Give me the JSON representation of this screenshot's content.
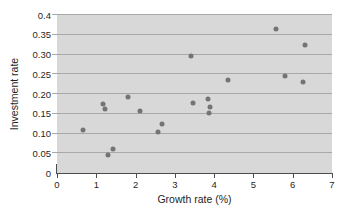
{
  "chart_data": {
    "type": "scatter",
    "xlabel": "Growth rate (%)",
    "ylabel": "Investment rate",
    "xlim": [
      0,
      7
    ],
    "ylim": [
      0,
      0.4
    ],
    "x_ticks": [
      0,
      1,
      2,
      3,
      4,
      5,
      6,
      7
    ],
    "x_tick_labels": [
      "0",
      "1",
      "2",
      "3",
      "4",
      "5",
      "6",
      "7"
    ],
    "y_ticks": [
      0,
      0.05,
      0.1,
      0.15,
      0.2,
      0.25,
      0.3,
      0.35,
      0.4
    ],
    "y_tick_labels": [
      "0",
      "0.05",
      "0.10",
      "0.15",
      "0.20",
      "0.25",
      "0.30",
      "0.35",
      "0.4"
    ],
    "grid": "horizontal",
    "legend": "none",
    "points": [
      [
        0.66,
        0.11
      ],
      [
        1.17,
        0.175
      ],
      [
        1.21,
        0.163
      ],
      [
        1.3,
        0.046
      ],
      [
        1.43,
        0.061
      ],
      [
        1.81,
        0.192
      ],
      [
        2.1,
        0.158
      ],
      [
        2.57,
        0.104
      ],
      [
        2.67,
        0.125
      ],
      [
        3.41,
        0.296
      ],
      [
        3.45,
        0.177
      ],
      [
        3.84,
        0.187
      ],
      [
        3.89,
        0.167
      ],
      [
        3.87,
        0.152
      ],
      [
        4.35,
        0.235
      ],
      [
        5.57,
        0.364
      ],
      [
        5.8,
        0.246
      ],
      [
        6.26,
        0.23
      ],
      [
        6.31,
        0.324
      ]
    ],
    "colors": {
      "page_bg": "#ffffff",
      "plot_bg": "#d8d8d8",
      "gridline": "#a8a8a8",
      "axis": "#4d4d4d",
      "point": "#747474",
      "text": "#1f1f1f"
    }
  }
}
